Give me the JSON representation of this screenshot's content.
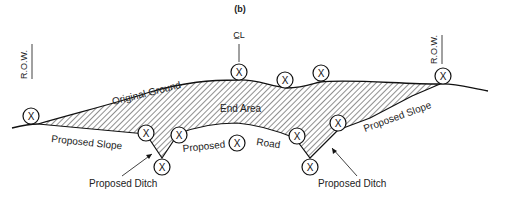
{
  "figure": {
    "label": "(b)",
    "row_left": "R.O.W.",
    "row_right": "R.O.W.",
    "centerline": "C̲L",
    "labels": {
      "original_ground": "Original Ground",
      "end_area": "End Area",
      "proposed_slope_left": "Proposed Slope",
      "proposed_slope_right": "Proposed Slope",
      "proposed_road_1": "Proposed",
      "proposed_road_2": "Road",
      "proposed_ditch_left": "Proposed Ditch",
      "proposed_ditch_right": "Proposed Ditch"
    },
    "point_marker": "X",
    "colors": {
      "line": "#111111",
      "hatch": "#333333",
      "background": "#ffffff"
    }
  }
}
